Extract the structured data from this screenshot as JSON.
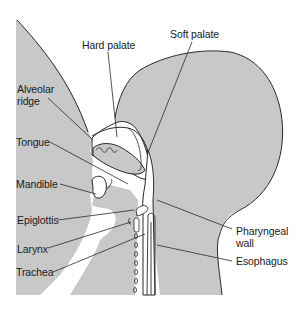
{
  "diagram": {
    "type": "anatomical-cross-section",
    "colors": {
      "tissue_fill": "#c8c8c8",
      "cavity_fill": "#ffffff",
      "outline": "#2a2a2a",
      "label_text": "#1a1a1a",
      "background": "#ffffff"
    },
    "labels": {
      "hard_palate": "Hard palate",
      "soft_palate": "Soft palate",
      "alveolar_ridge_line1": "Alveolar",
      "alveolar_ridge_line2": "ridge",
      "tongue": "Tongue",
      "mandible": "Mandible",
      "epiglottis": "Epiglottis",
      "larynx": "Larynx",
      "trachea": "Trachea",
      "pharyngeal_wall_line1": "Pharyngeal",
      "pharyngeal_wall_line2": "wall",
      "esophagus": "Esophagus"
    }
  }
}
